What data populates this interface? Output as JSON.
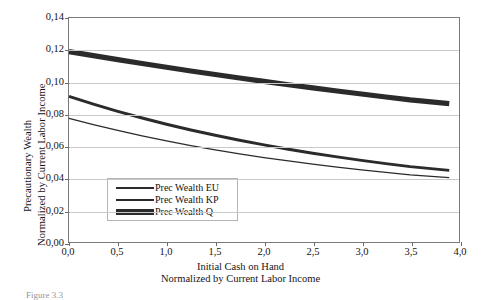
{
  "figure": {
    "caption": "Figure 3.3"
  },
  "axes": {
    "y": {
      "title_line1": "Precautionary Wealth",
      "title_line2": "Normalized by Current Labor Income",
      "ticks": [
        "0,00",
        "0,02",
        "0,04",
        "0,06",
        "0,08",
        "0,10",
        "0,12",
        "0,14"
      ],
      "min": 0,
      "max": 0.14
    },
    "x": {
      "title_line1": "Initial Cash on Hand",
      "title_line2": "Normalized by Current Labor Income",
      "ticks": [
        "0,0",
        "0,5",
        "1,0",
        "1,5",
        "2,0",
        "2,5",
        "3,0",
        "3,5",
        "4,0"
      ],
      "min": 0,
      "max": 4.0
    }
  },
  "legend": {
    "items": [
      {
        "label": "Prec Wealth EU",
        "style": "thin"
      },
      {
        "label": "Prec Wealth KP",
        "style": "medium"
      },
      {
        "label": "Prec Wealth Q",
        "style": "thick"
      }
    ]
  },
  "colors": {
    "series": "#2b2b2b",
    "grid": "#c9c9c9",
    "frame": "#7a7a7a",
    "background": "#ffffff",
    "text": "#141414"
  },
  "chart_data": {
    "type": "line",
    "title": "",
    "xlabel": "Initial Cash on Hand / Normalized by Current Labor Income",
    "ylabel": "Precautionary Wealth / Normalized by Current Labor Income",
    "xlim": [
      0,
      4.0
    ],
    "ylim": [
      0,
      0.14
    ],
    "grid": true,
    "legend_position": "inside-lower-left",
    "x": [
      0.0,
      0.25,
      0.5,
      0.75,
      1.0,
      1.25,
      1.5,
      1.75,
      2.0,
      2.25,
      2.5,
      2.75,
      3.0,
      3.25,
      3.5,
      3.9
    ],
    "series": [
      {
        "name": "Prec Wealth Q",
        "linewidth": "thick",
        "values": [
          0.119,
          0.1165,
          0.114,
          0.1116,
          0.1092,
          0.1069,
          0.1047,
          0.1025,
          0.1004,
          0.0983,
          0.0963,
          0.0944,
          0.0925,
          0.0906,
          0.0888,
          0.0865
        ]
      },
      {
        "name": "Prec Wealth KP",
        "linewidth": "medium",
        "values": [
          0.091,
          0.0862,
          0.0817,
          0.0775,
          0.0736,
          0.07,
          0.0667,
          0.0636,
          0.0607,
          0.058,
          0.0555,
          0.0532,
          0.051,
          0.049,
          0.0471,
          0.0448
        ]
      },
      {
        "name": "Prec Wealth EU",
        "linewidth": "thin",
        "values": [
          0.0772,
          0.0733,
          0.0697,
          0.0663,
          0.0632,
          0.0603,
          0.0576,
          0.0551,
          0.0528,
          0.0507,
          0.0487,
          0.0468,
          0.0451,
          0.0435,
          0.042,
          0.0402
        ]
      }
    ]
  }
}
